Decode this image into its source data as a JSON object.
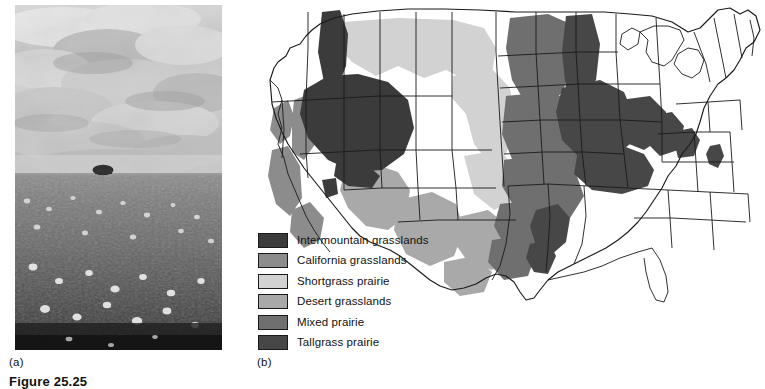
{
  "figure": {
    "caption": "Figure 25.25",
    "panels": [
      {
        "letter": "(a)",
        "name": "prairie-photograph"
      },
      {
        "letter": "(b)",
        "name": "grassland-distribution-map"
      }
    ]
  },
  "photo": {
    "description": "Black and white photograph of a tallgrass prairie in bloom under a cloudy sky",
    "sky_tone": "#cfcfcf",
    "ground_tone": "#5a5a5a",
    "horizon_bush": "dark shrub on horizon"
  },
  "map": {
    "title": "Grasslands of the United States",
    "region": "Contiguous United States",
    "outline_color": "#1a1a1a",
    "background": "#ffffff"
  },
  "legend": {
    "items": [
      {
        "label": "Intermountain grasslands",
        "color": "#3b3b3b"
      },
      {
        "label": "California grasslands",
        "color": "#8c8c8c"
      },
      {
        "label": "Shortgrass prairie",
        "color": "#d2d2d2"
      },
      {
        "label": "Desert grasslands",
        "color": "#a9a9a9"
      },
      {
        "label": "Mixed prairie",
        "color": "#6f6f6f"
      },
      {
        "label": "Tallgrass prairie",
        "color": "#474747"
      }
    ]
  }
}
